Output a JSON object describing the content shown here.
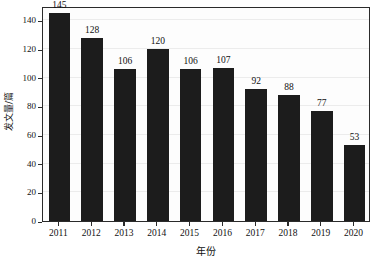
{
  "chart_data": {
    "type": "bar",
    "title": "",
    "subtitle": "",
    "xlabel": "年份",
    "ylabel": "发文量/篇",
    "categories": [
      "2011",
      "2012",
      "2013",
      "2014",
      "2015",
      "2016",
      "2017",
      "2018",
      "2019",
      "2020"
    ],
    "values": [
      145,
      128,
      106,
      120,
      106,
      107,
      92,
      88,
      77,
      53
    ],
    "value_labels": [
      "145",
      "128",
      "106",
      "120",
      "106",
      "107",
      "92",
      "88",
      "77",
      "53"
    ],
    "ylim": [
      0,
      150
    ],
    "xlim_note": "categorical",
    "y_ticks": [
      0,
      20,
      40,
      60,
      80,
      100,
      120,
      140
    ],
    "y_tick_labels": [
      "0",
      "20",
      "40",
      "60",
      "80",
      "100",
      "120",
      "140"
    ],
    "grid": "horizontal-light",
    "legend": "none",
    "legend_position": "none",
    "bar_color": "#1c1c1c",
    "axis_color": "#2b2b2b",
    "gridline_color": "#ececec",
    "plot_background": "#fdfdfd",
    "text_color": "#111111"
  }
}
